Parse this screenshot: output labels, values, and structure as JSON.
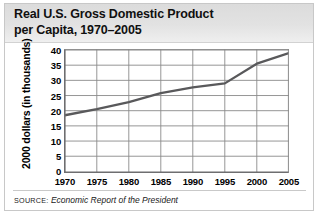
{
  "figure": {
    "title_line1": "Real U.S. Gross Domestic Product",
    "title_line2": "per Capita, 1970–2005",
    "source_prefix": "SOURCE:",
    "source_text": "Economic Report of the President",
    "colors": {
      "line": "#59595b",
      "grid": "#8a8a8a",
      "axis": "#6e6e70",
      "header_bg": "#e0e0e0",
      "border": "#c8c8c8",
      "text": "#101010"
    }
  },
  "chart_data": {
    "type": "line",
    "title": "Real U.S. Gross Domestic Product per Capita, 1970–2005",
    "xlabel": "",
    "ylabel": "2000 dollars (in thousands)",
    "x": [
      1970,
      1975,
      1980,
      1985,
      1990,
      1995,
      2000,
      2005
    ],
    "values": [
      18.5,
      20.5,
      22.8,
      25.8,
      27.7,
      29.0,
      35.5,
      39.0
    ],
    "xticks": [
      "1970",
      "1975",
      "1980",
      "1985",
      "1990",
      "1995",
      "2000",
      "2005"
    ],
    "yticks": [
      "0",
      "5",
      "10",
      "15",
      "20",
      "25",
      "30",
      "35",
      "40"
    ],
    "xlim": [
      1970,
      2005
    ],
    "ylim": [
      0,
      40
    ],
    "grid": true,
    "legend": null,
    "series": [
      {
        "name": "Real GDP per capita (2000 dollars, thousands)",
        "values": [
          18.5,
          20.5,
          22.8,
          25.8,
          27.7,
          29.0,
          35.5,
          39.0
        ]
      }
    ]
  }
}
